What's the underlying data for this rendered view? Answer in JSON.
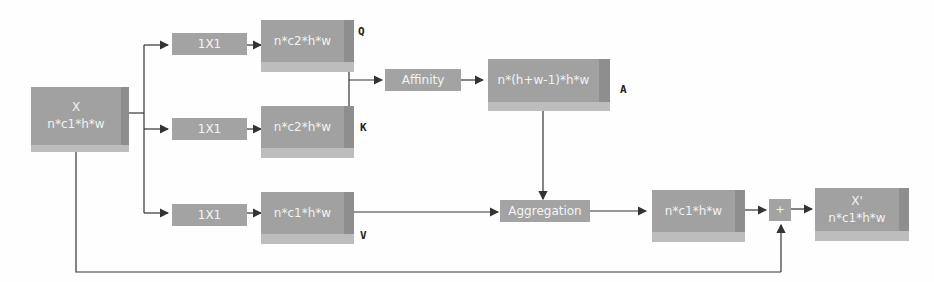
{
  "diagram": {
    "input": {
      "title": "X",
      "shape": "n*c1*h*w"
    },
    "branches": {
      "q": {
        "conv": "1X1",
        "tensor": "n*c2*h*w",
        "label": "Q"
      },
      "k": {
        "conv": "1X1",
        "tensor": "n*c2*h*w",
        "label": "K"
      },
      "v": {
        "conv": "1X1",
        "tensor": "n*c1*h*w",
        "label": "V"
      }
    },
    "affinity": {
      "op": "Affinity",
      "tensor": "n*(h+w-1)*h*w",
      "label": "A"
    },
    "aggregation": {
      "op": "Aggregation",
      "tensor": "n*c1*h*w"
    },
    "add": {
      "op": "+"
    },
    "output": {
      "title": "X'",
      "shape": "n*c1*h*w"
    },
    "colors": {
      "box": "#a3a3a3",
      "box_side": "#8e8e8e",
      "text": "#f4f4f4",
      "line": "#333333"
    }
  }
}
